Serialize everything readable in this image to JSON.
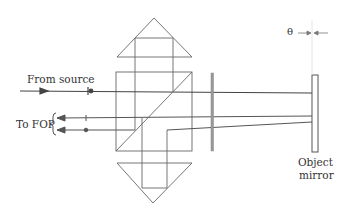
{
  "labels": {
    "from_source": "From source",
    "to_fop": "To FOP",
    "theta": "θ",
    "object_mirror_line1": "Object",
    "object_mirror_line2": "mirror"
  },
  "colors": {
    "line": "#555555",
    "beam": "#444444",
    "plate": "#888888"
  }
}
